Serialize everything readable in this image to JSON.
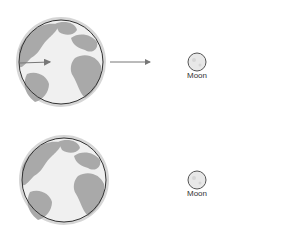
{
  "diagram": {
    "panels": [
      {
        "earth": {
          "cx": 61,
          "cy": 62,
          "r": 42,
          "halo": 45
        },
        "internal_arrow": true,
        "external_arrow": true,
        "moon": {
          "cx": 197,
          "cy": 62,
          "r": 9,
          "label": "Moon"
        }
      },
      {
        "earth": {
          "cx": 64,
          "cy": 180,
          "r": 42,
          "halo": 45
        },
        "internal_arrow": false,
        "external_arrow": false,
        "moon": {
          "cx": 197,
          "cy": 180,
          "r": 9,
          "label": "Moon"
        }
      }
    ]
  },
  "colors": {
    "halo": "#d6d6d6",
    "ocean": "#f0f0f0",
    "land": "#a9a9a9",
    "outline": "#333333",
    "arrow": "#777777",
    "moon_fill": "#e8e8e8",
    "moon_outline": "#555555"
  }
}
